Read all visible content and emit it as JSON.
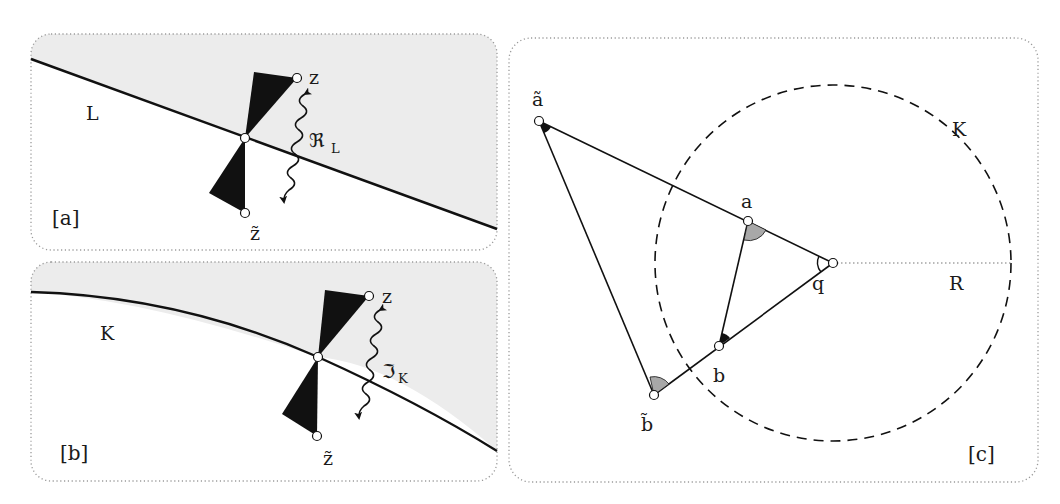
{
  "figure": {
    "panels": [
      {
        "tag": "[a]",
        "curve_label": "L",
        "curve_type": "straight line",
        "upper_point_label": "z",
        "lower_point_label": "z̃",
        "operator_label": "ℜ",
        "operator_subscript": "L"
      },
      {
        "tag": "[b]",
        "curve_label": "K",
        "curve_type": "circular arc",
        "upper_point_label": "z",
        "lower_point_label": "z̃",
        "operator_label": "ℑ",
        "operator_subscript": "K"
      },
      {
        "tag": "[c]",
        "circle_label": "K",
        "radius_label": "R",
        "center_label": "q",
        "points": {
          "a_tilde": "ã",
          "b_tilde": "b̃",
          "a": "a",
          "b": "b"
        }
      }
    ],
    "colors": {
      "stroke": "#111111",
      "shade": "#ececec",
      "angle_gray": "#a8a8a8",
      "frame": "#9a9a9a"
    }
  }
}
